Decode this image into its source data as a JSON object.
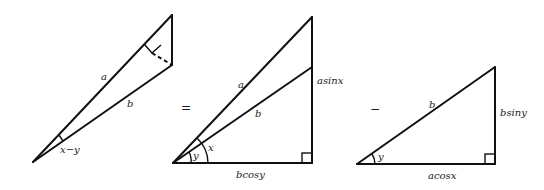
{
  "figure": {
    "colors": {
      "line": "#111111",
      "background": "#ffffff"
    },
    "operators": {
      "equals": "=",
      "minus": "−"
    },
    "triangle1": {
      "labels": {
        "hyp_a": "a",
        "side_b": "b",
        "angle": "x−y"
      },
      "marks": [
        "right-angle-mark",
        "dashed-perpendicular"
      ]
    },
    "triangle2": {
      "labels": {
        "hyp_a": "a",
        "side_b": "b",
        "vertical": "asinx",
        "base": "bcosy",
        "angle_outer": "x",
        "angle_inner": "y"
      },
      "marks": [
        "right-angle-mark"
      ]
    },
    "triangle3": {
      "labels": {
        "hyp_b": "b",
        "vertical": "bsiny",
        "base": "acosx",
        "angle": "y"
      },
      "marks": [
        "right-angle-mark"
      ]
    }
  }
}
